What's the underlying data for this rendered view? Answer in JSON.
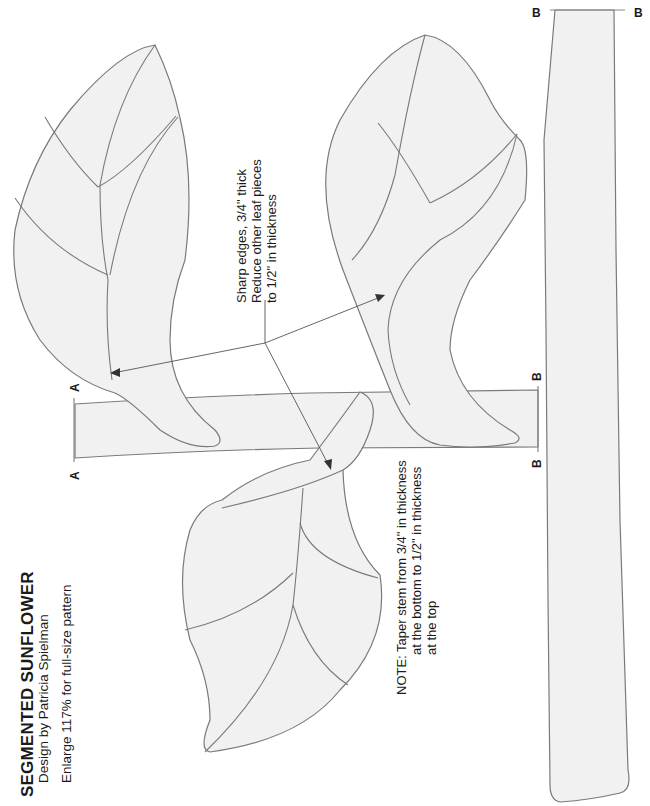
{
  "header": {
    "title": "SEGMENTED SUNFLOWER",
    "subtitle": "Design by Patricia Spielman",
    "enlarge_note": "Enlarge 117% for full-size pattern"
  },
  "callouts": {
    "sharp_edges": {
      "line1": "Sharp edges, 3/4\" thick",
      "line2": "Reduce other leaf pieces",
      "line3": "to 1/2\" in thickness"
    },
    "taper_note": {
      "line1": "NOTE:  Taper stem from 3/4\" in thickness",
      "line2": "at the bottom to 1/2\" in thickness",
      "line3": "at the top"
    }
  },
  "cut_labels": {
    "a_top": "A",
    "a_bottom": "A",
    "b_stem_top": "B",
    "b_stem_bottom": "B",
    "b_long_left": "B",
    "b_long_right": "B"
  },
  "pieces": [
    {
      "name": "left-leaf",
      "segments": 5
    },
    {
      "name": "right-leaf",
      "segments": 5
    },
    {
      "name": "lower-leaf",
      "segments": 6
    },
    {
      "name": "short-stem-section",
      "ends": [
        "A",
        "B"
      ]
    },
    {
      "name": "long-stem-section",
      "ends": [
        "B"
      ]
    }
  ],
  "colors": {
    "piece_fill": "#f1f1f1",
    "outline": "#7a7a7a",
    "text": "#1a1a1a"
  }
}
